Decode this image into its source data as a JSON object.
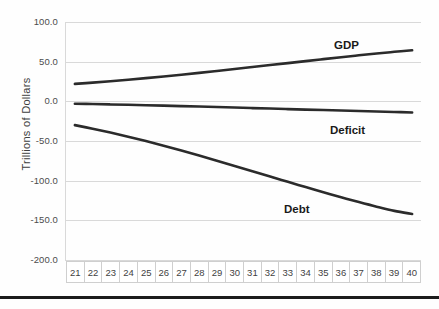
{
  "chart_data": {
    "type": "line",
    "title": "",
    "xlabel": "",
    "ylabel": "Trillions of Dollars",
    "x": [
      21,
      22,
      23,
      24,
      25,
      26,
      27,
      28,
      29,
      30,
      31,
      32,
      33,
      34,
      35,
      36,
      37,
      38,
      39,
      40
    ],
    "categories": [
      "21",
      "22",
      "23",
      "24",
      "25",
      "26",
      "27",
      "28",
      "29",
      "30",
      "31",
      "32",
      "33",
      "34",
      "35",
      "36",
      "37",
      "38",
      "39",
      "40"
    ],
    "ylim": [
      -200.0,
      100.0
    ],
    "yticks": [
      100.0,
      50.0,
      0.0,
      -50.0,
      -100.0,
      -150.0,
      -200.0
    ],
    "ytick_labels": [
      "100.0",
      "50.0",
      "0.0",
      "-50.0",
      "-100.0",
      "-150.0",
      "-200.0"
    ],
    "grid": true,
    "legend_position": "inline-annotations",
    "series": [
      {
        "name": "GDP",
        "color": "#2b2b2b",
        "values": [
          22.0,
          23.6,
          25.4,
          27.3,
          29.3,
          31.4,
          33.6,
          35.9,
          38.3,
          40.7,
          43.2,
          45.7,
          48.2,
          50.7,
          53.2,
          55.6,
          58.0,
          60.3,
          62.4,
          64.3
        ]
      },
      {
        "name": "Deficit",
        "color": "#2b2b2b",
        "values": [
          -3.0,
          -3.4,
          -3.9,
          -4.4,
          -4.9,
          -5.4,
          -6.0,
          -6.6,
          -7.2,
          -7.8,
          -8.5,
          -9.1,
          -9.8,
          -10.4,
          -11.0,
          -11.6,
          -12.2,
          -12.8,
          -13.4,
          -14.0
        ]
      },
      {
        "name": "Debt",
        "color": "#2b2b2b",
        "values": [
          -30.0,
          -34.5,
          -39.4,
          -44.6,
          -50.1,
          -55.9,
          -62.0,
          -68.3,
          -74.8,
          -81.4,
          -88.1,
          -94.8,
          -101.5,
          -108.1,
          -114.6,
          -120.9,
          -127.0,
          -132.8,
          -138.1,
          -142.0
        ]
      }
    ],
    "annotations": [
      {
        "text": "GDP",
        "series": "GDP"
      },
      {
        "text": "Deficit",
        "series": "Deficit"
      },
      {
        "text": "Debt",
        "series": "Debt"
      }
    ]
  },
  "axis": {
    "y_title": "Trillions of Dollars"
  },
  "labels": {
    "gdp": "GDP",
    "deficit": "Deficit",
    "debt": "Debt"
  }
}
